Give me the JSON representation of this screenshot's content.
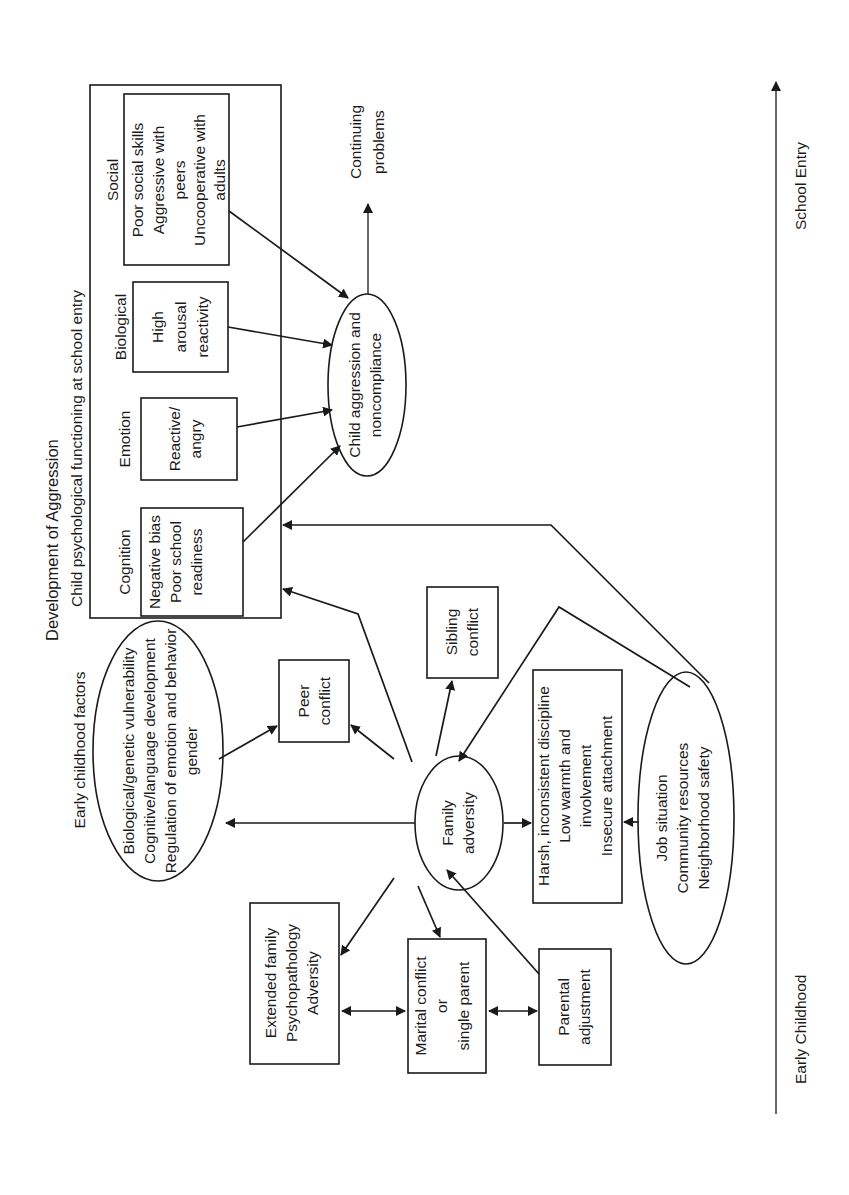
{
  "title": "Development of Aggression",
  "orientation": "rotated -90deg (reads bottom-to-top)",
  "colors": {
    "ink": "#1a1a1a",
    "background": "#ffffff"
  },
  "school_functioning": {
    "heading": "Child psychological functioning at school entry",
    "domains": [
      {
        "label": "Social",
        "lines": [
          "Poor social skills",
          "Aggressive with",
          "peers",
          "Uncooperative with",
          "adults"
        ]
      },
      {
        "label": "Biological",
        "lines": [
          "High",
          "arousal",
          "reactivity"
        ]
      },
      {
        "label": "Emotion",
        "lines": [
          "Reactive/",
          "angry"
        ]
      },
      {
        "label": "Cognition",
        "lines": [
          "Negative bias",
          "Poor school",
          "readiness"
        ]
      }
    ]
  },
  "outcome": {
    "lines": [
      "Child aggression and",
      "noncompliance"
    ]
  },
  "continuing": {
    "lines": [
      "Continuing",
      "problems"
    ]
  },
  "early_childhood": {
    "heading": "Early childhood factors",
    "lines": [
      "Biological/genetic vulnerability",
      "Cognitive/language development",
      "Regulation of emotion and behavior",
      "gender"
    ]
  },
  "peer_conflict": {
    "lines": [
      "Peer",
      "conflict"
    ]
  },
  "sibling_conflict": {
    "lines": [
      "Sibling",
      "conflict"
    ]
  },
  "family_adversity": {
    "lines": [
      "Family",
      "adversity"
    ]
  },
  "parenting": {
    "lines": [
      "Harsh, inconsistent discipline",
      "Low warmth and",
      "involvement",
      "Insecure attachment"
    ]
  },
  "community": {
    "lines": [
      "Job situation",
      "Community resources",
      "Neighborhood safety"
    ]
  },
  "extended_family": {
    "lines": [
      "Extended family",
      "Psychopathology",
      "Adversity"
    ]
  },
  "marital": {
    "lines": [
      "Marital conflict",
      "or",
      "single parent"
    ]
  },
  "parental_adjustment": {
    "lines": [
      "Parental",
      "adjustment"
    ]
  },
  "timeline": {
    "start_label": "Early Childhood",
    "end_label": "School Entry"
  }
}
